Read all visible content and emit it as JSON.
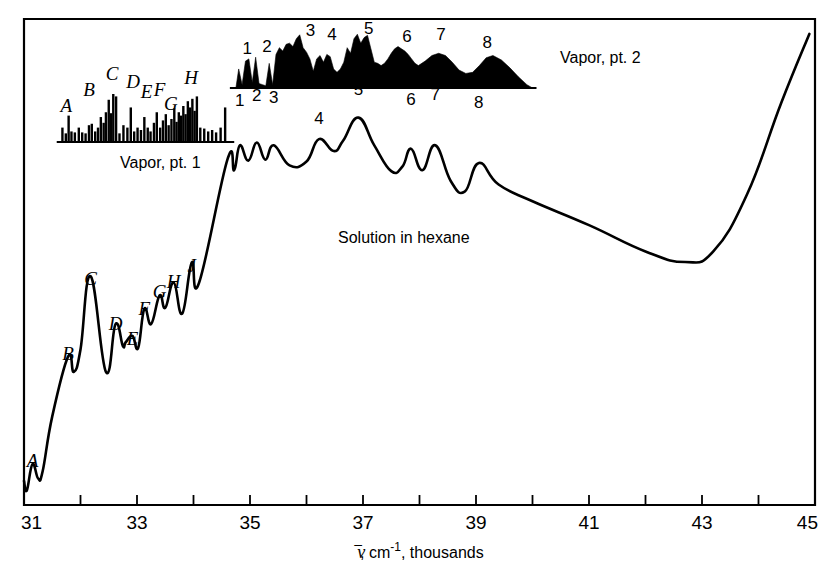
{
  "figure": {
    "title": "",
    "background_color": "#ffffff",
    "line_color": "#000000",
    "frame_color": "#000000"
  },
  "axis": {
    "xlabel_parts": {
      "nu": "ν",
      "rest_a": ", cm",
      "exponent": "-1",
      "rest_b": ", thousands"
    },
    "xlabel_full": "ν̄, cm-1, thousands",
    "xlim": [
      31,
      45
    ],
    "major_ticks": [
      31,
      33,
      35,
      37,
      39,
      41,
      43,
      45
    ],
    "minor_ticks": [
      32,
      34,
      36,
      38,
      40,
      42,
      44
    ],
    "tick_labels": [
      "31",
      "33",
      "35",
      "37",
      "39",
      "41",
      "43",
      "45"
    ],
    "ylabel": "",
    "y_ticks": []
  },
  "annotations": [
    {
      "name": "vapor-pt1-label",
      "text": "Vapor, pt. 1",
      "x": 120,
      "y": 168
    },
    {
      "name": "vapor-pt2-label",
      "text": "Vapor, pt. 2",
      "x": 560,
      "y": 63
    },
    {
      "name": "solution-label",
      "text": "Solution in hexane",
      "x": 338,
      "y": 243
    }
  ],
  "chart_data": {
    "type": "line",
    "xlabel": "ν̄, cm-1, thousands",
    "ylabel": "Absorption",
    "xlim": [
      31,
      45
    ],
    "ylim": [
      0,
      1
    ],
    "grid": false,
    "legend_position": "inline-annotations",
    "series": [
      {
        "name": "Solution in hexane",
        "type": "line",
        "style": "solid",
        "peak_labels": [
          {
            "label": "A",
            "x": 31.15
          },
          {
            "label": "B",
            "x": 31.78
          },
          {
            "label": "C",
            "x": 32.18
          },
          {
            "label": "D",
            "x": 32.62
          },
          {
            "label": "E",
            "x": 32.92
          },
          {
            "label": "F",
            "x": 33.13
          },
          {
            "label": "G",
            "x": 33.4
          },
          {
            "label": "H",
            "x": 33.65
          },
          {
            "label": "J",
            "x": 33.97
          },
          {
            "label": "1",
            "x": 34.82
          },
          {
            "label": "2",
            "x": 35.12
          },
          {
            "label": "3",
            "x": 35.42
          },
          {
            "label": "4",
            "x": 36.22
          },
          {
            "label": "5",
            "x": 36.92
          },
          {
            "label": "6",
            "x": 37.85
          },
          {
            "label": "7",
            "x": 38.28
          },
          {
            "label": "8",
            "x": 39.05
          }
        ],
        "x": [
          31.0,
          31.05,
          31.15,
          31.25,
          31.33,
          31.5,
          31.78,
          31.88,
          32.0,
          32.18,
          32.45,
          32.62,
          32.75,
          32.8,
          32.92,
          33.02,
          33.13,
          33.25,
          33.4,
          33.5,
          33.65,
          33.8,
          33.97,
          34.1,
          34.6,
          34.72,
          34.82,
          34.97,
          35.12,
          35.27,
          35.42,
          35.7,
          36.0,
          36.22,
          36.48,
          36.65,
          36.92,
          37.2,
          37.5,
          37.7,
          37.85,
          38.05,
          38.28,
          38.55,
          38.8,
          39.05,
          39.4,
          40.0,
          41.0,
          42.0,
          42.7,
          43.2,
          43.8,
          44.4,
          44.9
        ],
        "y": [
          0.04,
          0.02,
          0.075,
          0.045,
          0.06,
          0.175,
          0.3,
          0.268,
          0.315,
          0.468,
          0.268,
          0.368,
          0.322,
          0.33,
          0.343,
          0.318,
          0.4,
          0.368,
          0.428,
          0.402,
          0.455,
          0.39,
          0.497,
          0.455,
          0.712,
          0.69,
          0.742,
          0.71,
          0.748,
          0.712,
          0.742,
          0.7,
          0.708,
          0.755,
          0.73,
          0.752,
          0.8,
          0.742,
          0.688,
          0.698,
          0.735,
          0.69,
          0.742,
          0.668,
          0.645,
          0.705,
          0.66,
          0.625,
          0.575,
          0.52,
          0.498,
          0.52,
          0.64,
          0.83,
          0.975
        ]
      },
      {
        "name": "Vapor, pt. 1",
        "type": "stick",
        "x_range": [
          31.65,
          34.65
        ],
        "note": "Rotational-vibrational line spectrum, vertical sticks of varying intensity",
        "lines": [
          {
            "x": 31.68,
            "h": 0.3
          },
          {
            "x": 31.74,
            "h": 0.18
          },
          {
            "x": 31.79,
            "h": 0.55
          },
          {
            "x": 31.84,
            "h": 0.22
          },
          {
            "x": 31.9,
            "h": 0.2
          },
          {
            "x": 31.97,
            "h": 0.3
          },
          {
            "x": 32.03,
            "h": 0.2
          },
          {
            "x": 32.09,
            "h": 0.18
          },
          {
            "x": 32.15,
            "h": 0.35
          },
          {
            "x": 32.2,
            "h": 0.38
          },
          {
            "x": 32.26,
            "h": 0.22
          },
          {
            "x": 32.31,
            "h": 0.3
          },
          {
            "x": 32.36,
            "h": 0.52
          },
          {
            "x": 32.41,
            "h": 0.4
          },
          {
            "x": 32.45,
            "h": 0.62
          },
          {
            "x": 32.5,
            "h": 0.88
          },
          {
            "x": 32.54,
            "h": 0.6
          },
          {
            "x": 32.58,
            "h": 1.0
          },
          {
            "x": 32.63,
            "h": 0.95
          },
          {
            "x": 32.69,
            "h": 0.18
          },
          {
            "x": 32.76,
            "h": 0.35
          },
          {
            "x": 32.83,
            "h": 0.3
          },
          {
            "x": 32.89,
            "h": 0.72
          },
          {
            "x": 32.95,
            "h": 0.22
          },
          {
            "x": 33.01,
            "h": 0.3
          },
          {
            "x": 33.07,
            "h": 0.25
          },
          {
            "x": 33.13,
            "h": 0.52
          },
          {
            "x": 33.19,
            "h": 0.3
          },
          {
            "x": 33.24,
            "h": 0.22
          },
          {
            "x": 33.3,
            "h": 0.4
          },
          {
            "x": 33.35,
            "h": 0.62
          },
          {
            "x": 33.41,
            "h": 0.3
          },
          {
            "x": 33.46,
            "h": 0.45
          },
          {
            "x": 33.51,
            "h": 0.58
          },
          {
            "x": 33.56,
            "h": 0.35
          },
          {
            "x": 33.61,
            "h": 0.48
          },
          {
            "x": 33.66,
            "h": 0.7
          },
          {
            "x": 33.7,
            "h": 0.42
          },
          {
            "x": 33.74,
            "h": 0.62
          },
          {
            "x": 33.78,
            "h": 0.55
          },
          {
            "x": 33.82,
            "h": 0.75
          },
          {
            "x": 33.86,
            "h": 0.58
          },
          {
            "x": 33.9,
            "h": 0.85
          },
          {
            "x": 33.94,
            "h": 0.72
          },
          {
            "x": 33.98,
            "h": 0.9
          },
          {
            "x": 34.02,
            "h": 0.65
          },
          {
            "x": 34.06,
            "h": 0.95
          },
          {
            "x": 34.12,
            "h": 0.3
          },
          {
            "x": 34.19,
            "h": 0.28
          },
          {
            "x": 34.26,
            "h": 0.22
          },
          {
            "x": 34.33,
            "h": 0.25
          },
          {
            "x": 34.4,
            "h": 0.2
          },
          {
            "x": 34.48,
            "h": 0.3
          },
          {
            "x": 34.56,
            "h": 0.72
          }
        ],
        "peak_labels": [
          {
            "label": "A",
            "x": 31.75
          },
          {
            "label": "B",
            "x": 32.15
          },
          {
            "label": "C",
            "x": 32.56
          },
          {
            "label": "D",
            "x": 32.93
          },
          {
            "label": "E",
            "x": 33.17
          },
          {
            "label": "F",
            "x": 33.4
          },
          {
            "label": "G",
            "x": 33.6
          },
          {
            "label": "H",
            "x": 33.96
          }
        ]
      },
      {
        "name": "Vapor, pt. 2",
        "type": "area",
        "fill": "#000000",
        "x_range": [
          34.75,
          40.0
        ],
        "note": "Filled continuum band spectrum with numbered maxima",
        "peak_labels": [
          {
            "label": "1",
            "x": 34.95
          },
          {
            "label": "2",
            "x": 35.3
          },
          {
            "label": "3",
            "x": 36.07
          },
          {
            "label": "4",
            "x": 36.45
          },
          {
            "label": "5",
            "x": 37.1
          },
          {
            "label": "6",
            "x": 37.78
          },
          {
            "label": "7",
            "x": 38.38
          },
          {
            "label": "8",
            "x": 39.2
          }
        ],
        "x": [
          34.75,
          34.8,
          34.86,
          34.92,
          34.98,
          35.04,
          35.1,
          35.16,
          35.22,
          35.28,
          35.34,
          35.4,
          35.46,
          35.52,
          35.58,
          35.64,
          35.7,
          35.76,
          35.82,
          35.88,
          35.94,
          36.0,
          36.06,
          36.12,
          36.18,
          36.24,
          36.3,
          36.36,
          36.42,
          36.48,
          36.54,
          36.6,
          36.66,
          36.72,
          36.78,
          36.84,
          36.9,
          36.96,
          37.02,
          37.08,
          37.14,
          37.2,
          37.26,
          37.32,
          37.38,
          37.44,
          37.5,
          37.56,
          37.62,
          37.68,
          37.74,
          37.8,
          37.86,
          37.92,
          37.98,
          38.1,
          38.22,
          38.34,
          38.46,
          38.58,
          38.7,
          38.82,
          38.94,
          39.06,
          39.18,
          39.3,
          39.45,
          39.6,
          39.75,
          39.9,
          40.0
        ],
        "y": [
          0.0,
          0.34,
          0.06,
          0.48,
          0.52,
          0.1,
          0.55,
          0.08,
          0.06,
          0.04,
          0.44,
          0.06,
          0.6,
          0.72,
          0.66,
          0.78,
          0.8,
          0.74,
          0.88,
          0.95,
          0.72,
          0.64,
          0.52,
          0.3,
          0.52,
          0.58,
          0.46,
          0.6,
          0.56,
          0.34,
          0.28,
          0.34,
          0.46,
          0.72,
          0.62,
          0.88,
          0.96,
          0.8,
          0.9,
          0.94,
          0.7,
          0.46,
          0.44,
          0.4,
          0.44,
          0.52,
          0.62,
          0.7,
          0.74,
          0.7,
          0.66,
          0.6,
          0.52,
          0.44,
          0.4,
          0.48,
          0.58,
          0.62,
          0.58,
          0.46,
          0.32,
          0.26,
          0.28,
          0.4,
          0.54,
          0.58,
          0.5,
          0.36,
          0.2,
          0.06,
          0.0
        ]
      }
    ]
  }
}
